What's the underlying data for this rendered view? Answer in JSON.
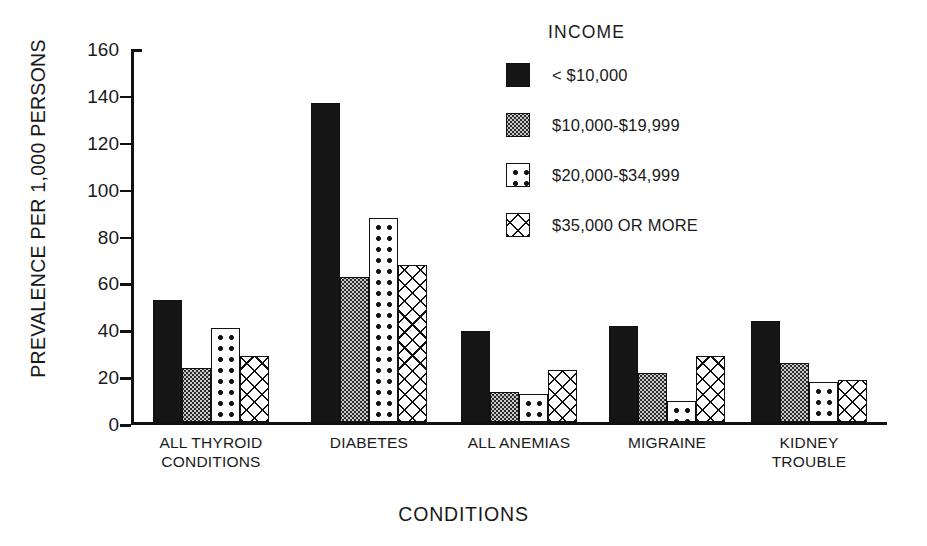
{
  "chart_data": {
    "type": "bar",
    "title": "",
    "xlabel": "CONDITIONS",
    "ylabel": "PREVALENCE PER 1,000 PERSONS",
    "ylim": [
      0,
      160
    ],
    "ytick_step": 20,
    "yticks": [
      "160",
      "140",
      "120",
      "100",
      "80",
      "60",
      "40",
      "20",
      "0"
    ],
    "grid": false,
    "legend_title": "INCOME",
    "legend_position": "upper right inside",
    "categories": [
      "ALL THYROID\nCONDITIONS",
      "DIABETES",
      "ALL ANEMIAS",
      "MIGRAINE",
      "KIDNEY\nTROUBLE"
    ],
    "series": [
      {
        "name": "< $10,000",
        "pattern": "solid",
        "values": [
          52,
          136,
          39,
          41,
          43
        ]
      },
      {
        "name": "$10,000-$19,999",
        "pattern": "fine-grid",
        "values": [
          23,
          62,
          13,
          21,
          25
        ]
      },
      {
        "name": "$20,000-$34,999",
        "pattern": "dots",
        "values": [
          40,
          87,
          12,
          9,
          17
        ]
      },
      {
        "name": "$35,000 OR MORE",
        "pattern": "crosshatch",
        "values": [
          28,
          67,
          22,
          28,
          18
        ]
      }
    ]
  },
  "axes": {
    "ylabel": "PREVALENCE PER 1,000 PERSONS",
    "xlabel": "CONDITIONS",
    "yticks": [
      {
        "label": "160"
      },
      {
        "label": "140"
      },
      {
        "label": "120"
      },
      {
        "label": "100"
      },
      {
        "label": "80"
      },
      {
        "label": "60"
      },
      {
        "label": "40"
      },
      {
        "label": "20"
      },
      {
        "label": "0"
      }
    ]
  },
  "groups": [
    {
      "line1": "ALL THYROID",
      "line2": "CONDITIONS"
    },
    {
      "line1": "DIABETES",
      "line2": ""
    },
    {
      "line1": "ALL ANEMIAS",
      "line2": ""
    },
    {
      "line1": "MIGRAINE",
      "line2": ""
    },
    {
      "line1": "KIDNEY",
      "line2": "TROUBLE"
    }
  ],
  "legend": {
    "title": "INCOME",
    "items": [
      {
        "label": "< $10,000"
      },
      {
        "label": "$10,000-$19,999"
      },
      {
        "label": "$20,000-$34,999"
      },
      {
        "label": "$35,000 OR MORE"
      }
    ]
  },
  "colors": {
    "ink": "#151515",
    "background": "#ffffff",
    "fine_grid_fill": "#c9c9c9"
  }
}
